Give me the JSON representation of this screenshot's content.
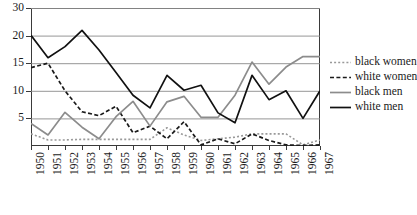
{
  "chart_data": {
    "type": "line",
    "title": "",
    "subtitle": "",
    "xlabel": "",
    "ylabel": "",
    "grid": true,
    "legend_position": "right",
    "x": [
      1950,
      1951,
      1952,
      1953,
      1954,
      1955,
      1956,
      1957,
      1958,
      1959,
      1960,
      1961,
      1962,
      1963,
      1964,
      1965,
      1966,
      1967
    ],
    "categories": [
      "1950",
      "1951",
      "1952",
      "1953",
      "1954",
      "1955",
      "1956",
      "1957",
      "1958",
      "1959",
      "1960",
      "1961",
      "1962",
      "1963",
      "1964",
      "1965",
      "1966",
      "1967"
    ],
    "xtick_labels": [
      "1950",
      "1951",
      "1952",
      "1953",
      "1954",
      "1955",
      "1956",
      "1957",
      "1958",
      "1959",
      "1960",
      "1961",
      "1962",
      "1963",
      "1964",
      "1965",
      "1966",
      "1967"
    ],
    "ytick_labels": [
      "0",
      "5",
      "10",
      "15",
      "20",
      "30"
    ],
    "ytick_values": [
      0,
      5,
      10,
      15,
      20,
      30
    ],
    "ylim": [
      0,
      30
    ],
    "y_axis_note": "Gridlines are evenly spaced but labelled 5, 10, 15, 20, 30; the 20-to-30 interval is compressed.",
    "series": [
      {
        "name": "black women",
        "color": "#999999",
        "style": "dotted",
        "values": [
          2.2,
          1.1,
          1.1,
          1.2,
          1.2,
          1.2,
          1.2,
          1.2,
          3.3,
          2.0,
          1.0,
          1.3,
          1.6,
          2.2,
          2.2,
          2.2,
          0.2,
          1.1
        ]
      },
      {
        "name": "white women",
        "color": "#1a1a1a",
        "style": "dashed",
        "values": [
          14.2,
          15.0,
          10.0,
          6.2,
          5.5,
          7.2,
          2.4,
          3.6,
          1.3,
          4.4,
          0.2,
          1.3,
          0.4,
          2.2,
          1.0,
          0.2,
          0.1,
          0.2
        ]
      },
      {
        "name": "black men",
        "color": "#8c8c8c",
        "style": "solid",
        "values": [
          4.1,
          2.0,
          6.1,
          3.4,
          1.3,
          5.3,
          8.1,
          3.6,
          8.0,
          9.0,
          5.2,
          5.2,
          9.2,
          15.2,
          11.2,
          14.3,
          16.2,
          16.2
        ]
      },
      {
        "name": "white men",
        "color": "#111111",
        "style": "solid",
        "values": [
          20.1,
          16.0,
          18.0,
          21.9,
          17.4,
          13.3,
          9.2,
          6.9,
          12.8,
          10.1,
          11.0,
          6.0,
          4.2,
          12.8,
          8.4,
          10.0,
          5.0,
          10.0
        ]
      }
    ]
  },
  "legend": {
    "items": [
      {
        "label": "black women"
      },
      {
        "label": "white women"
      },
      {
        "label": "black men"
      },
      {
        "label": "white men"
      }
    ]
  }
}
